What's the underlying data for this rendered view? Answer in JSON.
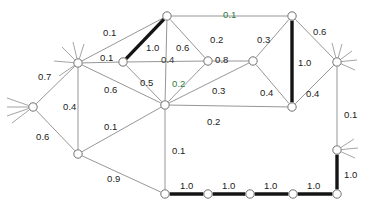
{
  "figure": {
    "type": "node-link-diagram",
    "width": 369,
    "height": 211,
    "background_color": "#ffffff",
    "edge_color": "#8a8a8a",
    "highlight_edge_color": "#141414",
    "node_fill_color": "#ffffff",
    "node_stroke_color": "#6f6f6f",
    "label_color": "#1b1b1b",
    "accent_label_color": "#2f7a41"
  },
  "graph_data": {
    "type": "graph",
    "node_count": 17,
    "edge_count": 26,
    "weight_range": [
      0.1,
      1.0
    ],
    "nodes": [
      {
        "id": "n0",
        "x": 33,
        "y": 107,
        "whiskers": true
      },
      {
        "id": "n1",
        "x": 78,
        "y": 63,
        "whiskers": true
      },
      {
        "id": "n2",
        "x": 78,
        "y": 154,
        "whiskers": false
      },
      {
        "id": "n3",
        "x": 123,
        "y": 62,
        "whiskers": false
      },
      {
        "id": "n4",
        "x": 167,
        "y": 16,
        "whiskers": false
      },
      {
        "id": "n5",
        "x": 165,
        "y": 105,
        "whiskers": false
      },
      {
        "id": "n6",
        "x": 208,
        "y": 61,
        "whiskers": false
      },
      {
        "id": "n7",
        "x": 253,
        "y": 61,
        "whiskers": false
      },
      {
        "id": "n8",
        "x": 292,
        "y": 16,
        "whiskers": false
      },
      {
        "id": "n9",
        "x": 292,
        "y": 107,
        "whiskers": false
      },
      {
        "id": "n10",
        "x": 337,
        "y": 62,
        "whiskers": true
      },
      {
        "id": "n11",
        "x": 337,
        "y": 150,
        "whiskers": true
      },
      {
        "id": "n12",
        "x": 337,
        "y": 194,
        "whiskers": false
      },
      {
        "id": "n13",
        "x": 293,
        "y": 194,
        "whiskers": false
      },
      {
        "id": "n14",
        "x": 250,
        "y": 194,
        "whiskers": false
      },
      {
        "id": "n15",
        "x": 208,
        "y": 194,
        "whiskers": false
      },
      {
        "id": "n16",
        "x": 165,
        "y": 194,
        "whiskers": false
      }
    ],
    "edges": [
      {
        "source": "n0",
        "target": "n1",
        "weight": "0.7",
        "highlight": false,
        "label_x": 38,
        "label_y": 72,
        "tint": ""
      },
      {
        "source": "n0",
        "target": "n2",
        "weight": "0.6",
        "highlight": false,
        "label_x": 36,
        "label_y": 132,
        "tint": ""
      },
      {
        "source": "n1",
        "target": "n2",
        "weight": "0.4",
        "highlight": false,
        "label_x": 63,
        "label_y": 102,
        "tint": ""
      },
      {
        "source": "n1",
        "target": "n4",
        "weight": "0.1",
        "highlight": false,
        "label_x": 103,
        "label_y": 28,
        "tint": ""
      },
      {
        "source": "n1",
        "target": "n3",
        "weight": "0.1",
        "highlight": false,
        "label_x": 100,
        "label_y": 53,
        "tint": ""
      },
      {
        "source": "n1",
        "target": "n5",
        "weight": "0.6",
        "highlight": false,
        "label_x": 104,
        "label_y": 85,
        "tint": ""
      },
      {
        "source": "n2",
        "target": "n5",
        "weight": "0.1",
        "highlight": false,
        "label_x": 104,
        "label_y": 122,
        "tint": ""
      },
      {
        "source": "n2",
        "target": "n16",
        "weight": "0.9",
        "highlight": false,
        "label_x": 107,
        "label_y": 174,
        "tint": ""
      },
      {
        "source": "n3",
        "target": "n4",
        "weight": "1.0",
        "highlight": true,
        "label_x": 146,
        "label_y": 43,
        "tint": ""
      },
      {
        "source": "n3",
        "target": "n6",
        "weight": "0.4",
        "highlight": false,
        "label_x": 161,
        "label_y": 55,
        "tint": "tint-gray"
      },
      {
        "source": "n3",
        "target": "n5",
        "weight": "0.5",
        "highlight": false,
        "label_x": 140,
        "label_y": 78,
        "tint": ""
      },
      {
        "source": "n4",
        "target": "n8",
        "weight": "0.1",
        "highlight": false,
        "label_x": 223,
        "label_y": 10,
        "tint": "tint-green"
      },
      {
        "source": "n4",
        "target": "n5",
        "weight": "0.6",
        "highlight": false,
        "label_x": 176,
        "label_y": 43,
        "tint": ""
      },
      {
        "source": "n4",
        "target": "n6",
        "weight": "0.2",
        "highlight": false,
        "label_x": 210,
        "label_y": 35,
        "tint": ""
      },
      {
        "source": "n5",
        "target": "n6",
        "weight": "0.2",
        "highlight": false,
        "label_x": 172,
        "label_y": 79,
        "tint": "tint-green"
      },
      {
        "source": "n5",
        "target": "n7",
        "weight": "0.3",
        "highlight": false,
        "label_x": 212,
        "label_y": 86,
        "tint": ""
      },
      {
        "source": "n5",
        "target": "n9",
        "weight": "0.2",
        "highlight": false,
        "label_x": 207,
        "label_y": 117,
        "tint": ""
      },
      {
        "source": "n5",
        "target": "n16",
        "weight": "0.1",
        "highlight": false,
        "label_x": 172,
        "label_y": 146,
        "tint": ""
      },
      {
        "source": "n6",
        "target": "n7",
        "weight": "0.8",
        "highlight": false,
        "label_x": 215,
        "label_y": 55,
        "tint": ""
      },
      {
        "source": "n7",
        "target": "n8",
        "weight": "0.3",
        "highlight": false,
        "label_x": 257,
        "label_y": 35,
        "tint": ""
      },
      {
        "source": "n7",
        "target": "n9",
        "weight": "0.4",
        "highlight": false,
        "label_x": 260,
        "label_y": 88,
        "tint": ""
      },
      {
        "source": "n8",
        "target": "n9",
        "weight": "1.0",
        "highlight": true,
        "label_x": 298,
        "label_y": 58,
        "tint": ""
      },
      {
        "source": "n8",
        "target": "n10",
        "weight": "0.6",
        "highlight": false,
        "label_x": 313,
        "label_y": 27,
        "tint": ""
      },
      {
        "source": "n9",
        "target": "n10",
        "weight": "0.4",
        "highlight": false,
        "label_x": 306,
        "label_y": 89,
        "tint": ""
      },
      {
        "source": "n10",
        "target": "n11",
        "weight": "0.1",
        "highlight": false,
        "label_x": 344,
        "label_y": 110,
        "tint": ""
      },
      {
        "source": "n11",
        "target": "n12",
        "weight": "1.0",
        "highlight": true,
        "label_x": 344,
        "label_y": 170,
        "tint": ""
      },
      {
        "source": "n12",
        "target": "n13",
        "weight": "1.0",
        "highlight": true,
        "label_x": 307,
        "label_y": 181,
        "tint": ""
      },
      {
        "source": "n13",
        "target": "n14",
        "weight": "1.0",
        "highlight": true,
        "label_x": 264,
        "label_y": 181,
        "tint": ""
      },
      {
        "source": "n14",
        "target": "n15",
        "weight": "1.0",
        "highlight": true,
        "label_x": 222,
        "label_y": 181,
        "tint": ""
      },
      {
        "source": "n15",
        "target": "n16",
        "weight": "1.0",
        "highlight": true,
        "label_x": 180,
        "label_y": 181,
        "tint": ""
      }
    ],
    "whiskers": {
      "n0": [
        [
          -26,
          -9
        ],
        [
          -26,
          0
        ],
        [
          -26,
          9
        ],
        [
          -21,
          16
        ]
      ],
      "n1": [
        [
          -24,
          -2
        ],
        [
          -16,
          -16
        ],
        [
          -5,
          -21
        ],
        [
          6,
          -19
        ],
        [
          -19,
          13
        ]
      ],
      "n10": [
        [
          15,
          -11
        ],
        [
          20,
          -2
        ],
        [
          18,
          8
        ],
        [
          5,
          -18
        ],
        [
          -5,
          -19
        ]
      ],
      "n11": [
        [
          17,
          -11
        ],
        [
          21,
          -2
        ],
        [
          18,
          8
        ]
      ]
    }
  }
}
